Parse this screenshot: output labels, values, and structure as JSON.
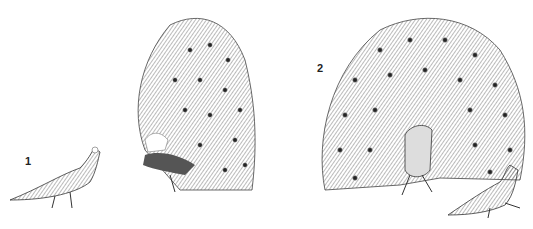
{
  "figure": {
    "background": "#ffffff",
    "ink_color": "#333333",
    "panels": [
      {
        "label": "1",
        "description": "peahen and peacock with raised fan seen from behind/side"
      },
      {
        "label": "2",
        "description": "peacock displaying full fan frontally with peahen walking"
      }
    ]
  }
}
